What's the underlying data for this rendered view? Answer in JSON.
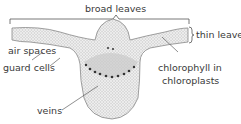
{
  "diagram": {
    "labels": {
      "broad_leaves": "broad leaves",
      "thin_leaves": "thin leaves",
      "air_spaces": "air spaces",
      "guard_cells": "guard cells",
      "chlorophyll_line1": "chlorophyll in",
      "chlorophyll_line2": "chloroplasts",
      "veins": "veins"
    }
  }
}
